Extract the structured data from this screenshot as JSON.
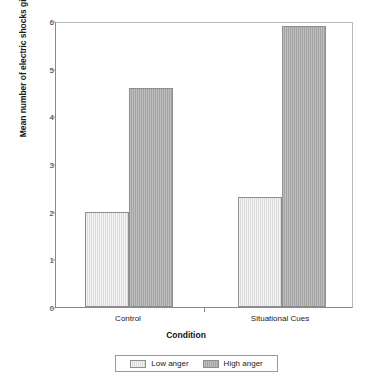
{
  "chart_data": {
    "type": "bar",
    "title": "",
    "xlabel": "Condition",
    "ylabel": "Mean number of electric shocks given to confederate",
    "categories": [
      "Control",
      "Situational Cues"
    ],
    "series": [
      {
        "name": "Low anger",
        "values": [
          2.0,
          2.3
        ],
        "color": "#dcdcdc"
      },
      {
        "name": "High anger",
        "values": [
          4.6,
          5.9
        ],
        "color": "#a3a3a3"
      }
    ],
    "ylim": [
      0,
      6
    ],
    "yticks": [
      6,
      5,
      4,
      3,
      2,
      1,
      0
    ],
    "ytick_labels": [
      "6",
      "5",
      "4",
      "3",
      "2",
      "1",
      "0"
    ],
    "grid": false,
    "legend_position": "bottom",
    "legend_entries": [
      "Low anger",
      "High anger"
    ]
  },
  "legend": {
    "items": [
      {
        "label": "Low anger",
        "swatch": "light-gray-swatch"
      },
      {
        "label": "High anger",
        "swatch": "dark-gray-swatch"
      }
    ]
  },
  "colors": {
    "low_anger": "#dcdcdc",
    "high_anger": "#a3a3a3",
    "axis": "#8a8a8a",
    "background": "#ffffff",
    "text": "#1a1a1a"
  }
}
